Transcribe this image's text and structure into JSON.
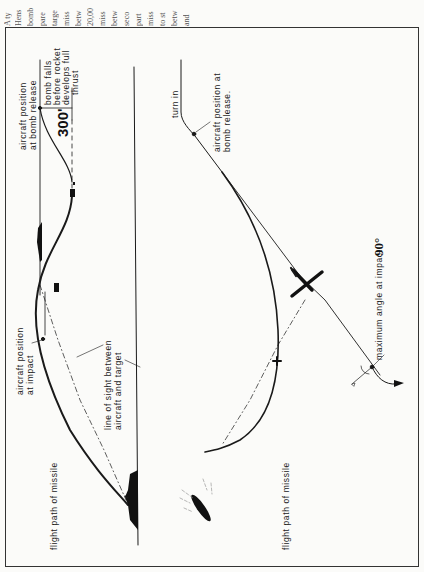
{
  "page": {
    "orientation": "rotated 90° counter-clockwise",
    "body_text_line_starts": [
      "A ty",
      "Hens",
      "bomb",
      "pare",
      "targe",
      "miss",
      "betw",
      "20,00",
      "miss",
      "betw",
      "seco",
      "part",
      "miss",
      "to st",
      "betw",
      "and"
    ]
  },
  "diagram_left": {
    "labels": {
      "aircraft_at_release": [
        "aircraft position",
        "at bomb  release"
      ],
      "bomb_falls": [
        "bomb falls",
        "before rocket",
        "develops full",
        "thrust"
      ],
      "drop_height": "300'",
      "aircraft_at_impact": [
        "aircraft position",
        "at impact"
      ],
      "line_of_sight": [
        "line of sight between",
        "aircraft and target"
      ],
      "flight_path": "flight path of missile"
    }
  },
  "diagram_right": {
    "labels": {
      "turn_in": "turn in",
      "aircraft_at_release": [
        "aircraft position at",
        "bomb release."
      ],
      "flight_path": "flight path of missile",
      "max_angle_prefix": "maximum angle at impact:",
      "max_angle_value": "90°"
    }
  },
  "colors": {
    "ink": "#1a1a1a",
    "paper": "#fbfbf9",
    "faint_text": "#555555"
  }
}
